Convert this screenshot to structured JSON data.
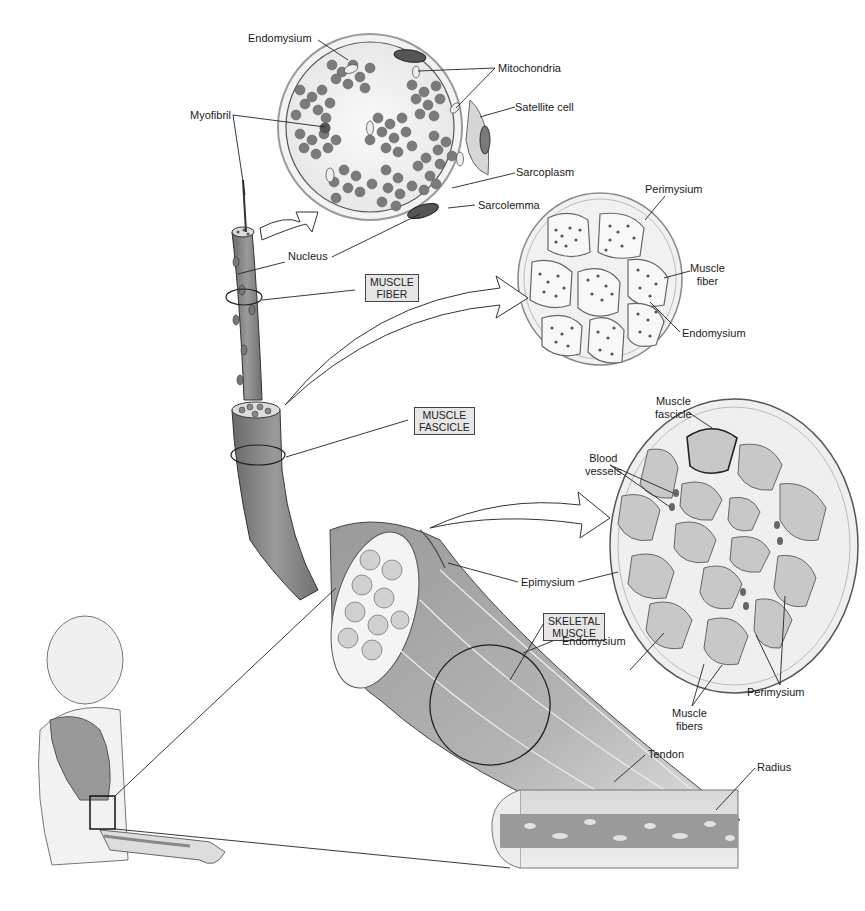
{
  "diagram": {
    "colors": {
      "muscle": "#8a8a8a",
      "muscle_light": "#c4c4c4",
      "myofibril": "#6e6e6e",
      "connective": "#dcdcdc",
      "label_box": "#e6e6e6",
      "line": "#222222"
    },
    "level_boxes": {
      "muscle_fiber": [
        "MUSCLE",
        "FIBER"
      ],
      "muscle_fascicle": [
        "MUSCLE",
        "FASCICLE"
      ],
      "skeletal_muscle": [
        "SKELETAL",
        "MUSCLE"
      ]
    },
    "fiber_cross_section": {
      "endomysium": "Endomysium",
      "mitochondria": "Mitochondria",
      "myofibril": "Myofibril",
      "satellite_cell": "Satellite cell",
      "sarcoplasm": "Sarcoplasm",
      "sarcolemma": "Sarcolemma",
      "nucleus": "Nucleus"
    },
    "fascicle_cross_section": {
      "perimysium": "Perimysium",
      "muscle_fiber": [
        "Muscle",
        "fiber"
      ],
      "endomysium": "Endomysium"
    },
    "muscle_cross_section": {
      "muscle_fascicle": [
        "Muscle",
        "fascicle"
      ],
      "blood_vessels": [
        "Blood",
        "vessels"
      ],
      "epimysium": "Epimysium",
      "endomysium": "Endomysium",
      "muscle_fibers": [
        "Muscle",
        "fibers"
      ],
      "perimysium": "Perimysium"
    },
    "bone": {
      "tendon": "Tendon",
      "radius": "Radius"
    }
  }
}
